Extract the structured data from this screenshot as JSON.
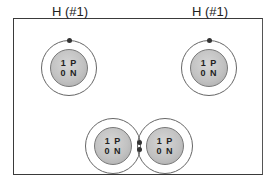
{
  "diagram": {
    "atoms": [
      {
        "id": "h-left",
        "label": "H (#1)",
        "protons": "1 P",
        "neutrons": "0 N"
      },
      {
        "id": "h-right",
        "label": "H (#1)",
        "protons": "1 P",
        "neutrons": "0 N"
      }
    ],
    "molecule": {
      "atoms": [
        {
          "protons": "1 P",
          "neutrons": "0 N"
        },
        {
          "protons": "1 P",
          "neutrons": "0 N"
        }
      ],
      "shared_electrons": 2
    },
    "colors": {
      "frame": "#3a3a3a",
      "shell": "#666666",
      "nucleus": "#c2c2c2",
      "electron": "#333333"
    }
  }
}
